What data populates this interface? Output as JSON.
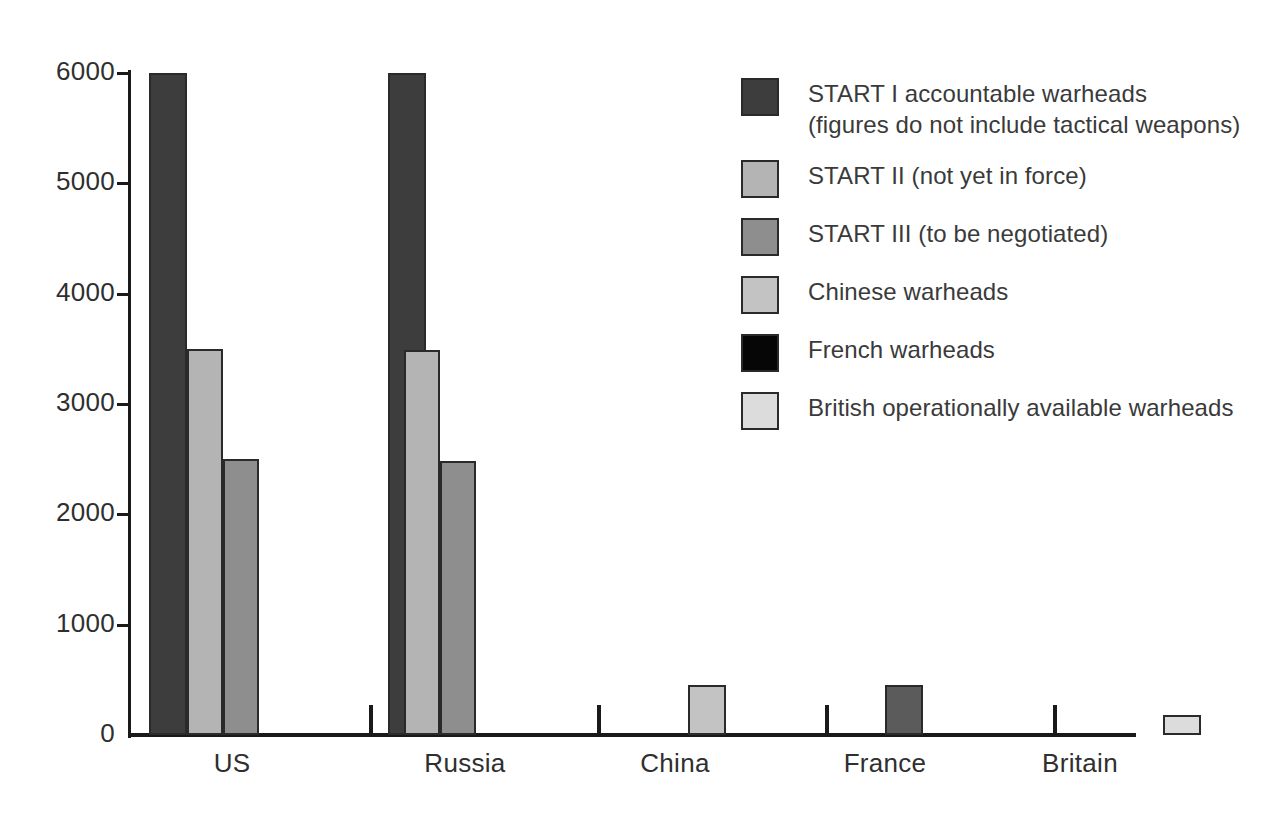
{
  "chart_data": {
    "type": "bar",
    "title": "",
    "subtitle": "",
    "xlabel": "",
    "ylabel": "",
    "categories": [
      "US",
      "Russia",
      "China",
      "France",
      "Britain"
    ],
    "ylim": [
      0,
      6000
    ],
    "y_ticks": [
      "0",
      "1000",
      "2000",
      "3000",
      "4000",
      "5000",
      "6000"
    ],
    "y_tick_values": [
      0,
      1000,
      2000,
      3000,
      4000,
      5000,
      6000
    ],
    "grid": false,
    "legend_position": "right",
    "series": [
      {
        "name": "START I accountable warheads\n(figures do not include tactical weapons)",
        "color": "#3d3d3d",
        "values": [
          6000,
          6000,
          null,
          null,
          null
        ]
      },
      {
        "name": "START II (not yet in force)",
        "color": "#b4b4b4",
        "values": [
          3500,
          3490,
          null,
          null,
          null
        ]
      },
      {
        "name": "START III (to be negotiated)",
        "color": "#8e8e8e",
        "values": [
          2500,
          2480,
          null,
          null,
          null
        ]
      },
      {
        "name": "Chinese warheads",
        "color": "#c3c3c3",
        "values": [
          null,
          null,
          450,
          null,
          null
        ]
      },
      {
        "name": "French warheads",
        "color": "#060606",
        "values": [
          null,
          null,
          null,
          450,
          null
        ]
      },
      {
        "name": "British operationally available warheads",
        "color": "#dcdcdc",
        "values": [
          null,
          null,
          null,
          null,
          185
        ]
      }
    ],
    "bars": [
      {
        "name": "us-start-i",
        "group": "US",
        "series": "START I accountable warheads",
        "value": 6000,
        "color": "#3d3d3d",
        "x": 149,
        "width": 38
      },
      {
        "name": "us-start-ii",
        "group": "US",
        "series": "START II (not yet in force)",
        "value": 3500,
        "color": "#b4b4b4",
        "x": 187,
        "width": 36
      },
      {
        "name": "us-start-iii",
        "group": "US",
        "series": "START III (to be negotiated)",
        "value": 2500,
        "color": "#8e8e8e",
        "x": 223,
        "width": 36
      },
      {
        "name": "russia-start-i",
        "group": "Russia",
        "series": "START I accountable warheads",
        "value": 6000,
        "color": "#3d3d3d",
        "x": 388,
        "width": 38
      },
      {
        "name": "russia-start-ii",
        "group": "Russia",
        "series": "START II (not yet in force)",
        "value": 3490,
        "color": "#b4b4b4",
        "x": 404,
        "width": 36
      },
      {
        "name": "russia-start-iii",
        "group": "Russia",
        "series": "START III (to be negotiated)",
        "value": 2480,
        "color": "#8e8e8e",
        "x": 440,
        "width": 36
      },
      {
        "name": "china-warheads",
        "group": "China",
        "series": "Chinese warheads",
        "value": 450,
        "color": "#c3c3c3",
        "x": 688,
        "width": 38
      },
      {
        "name": "france-warheads",
        "group": "France",
        "series": "French warheads",
        "value": 450,
        "color": "#5b5b5b",
        "x": 885,
        "width": 38
      },
      {
        "name": "britain-warheads",
        "group": "Britain",
        "series": "British operationally available warheads",
        "value": 185,
        "color": "#dcdcdc",
        "x": 1163,
        "width": 38
      }
    ],
    "x_group_tick_positions": [
      369,
      597,
      825,
      1053
    ],
    "x_label_centers": [
      232,
      465,
      675,
      885,
      1080
    ]
  },
  "legend": {
    "items": [
      {
        "label": "START I accountable warheads\n(figures do not include tactical weapons)",
        "color": "#3d3d3d"
      },
      {
        "label": "START II (not yet in force)",
        "color": "#b4b4b4"
      },
      {
        "label": "START III (to be negotiated)",
        "color": "#8e8e8e"
      },
      {
        "label": "Chinese warheads",
        "color": "#c3c3c3"
      },
      {
        "label": "French warheads",
        "color": "#060606"
      },
      {
        "label": "British operationally available warheads",
        "color": "#dcdcdc"
      }
    ]
  }
}
